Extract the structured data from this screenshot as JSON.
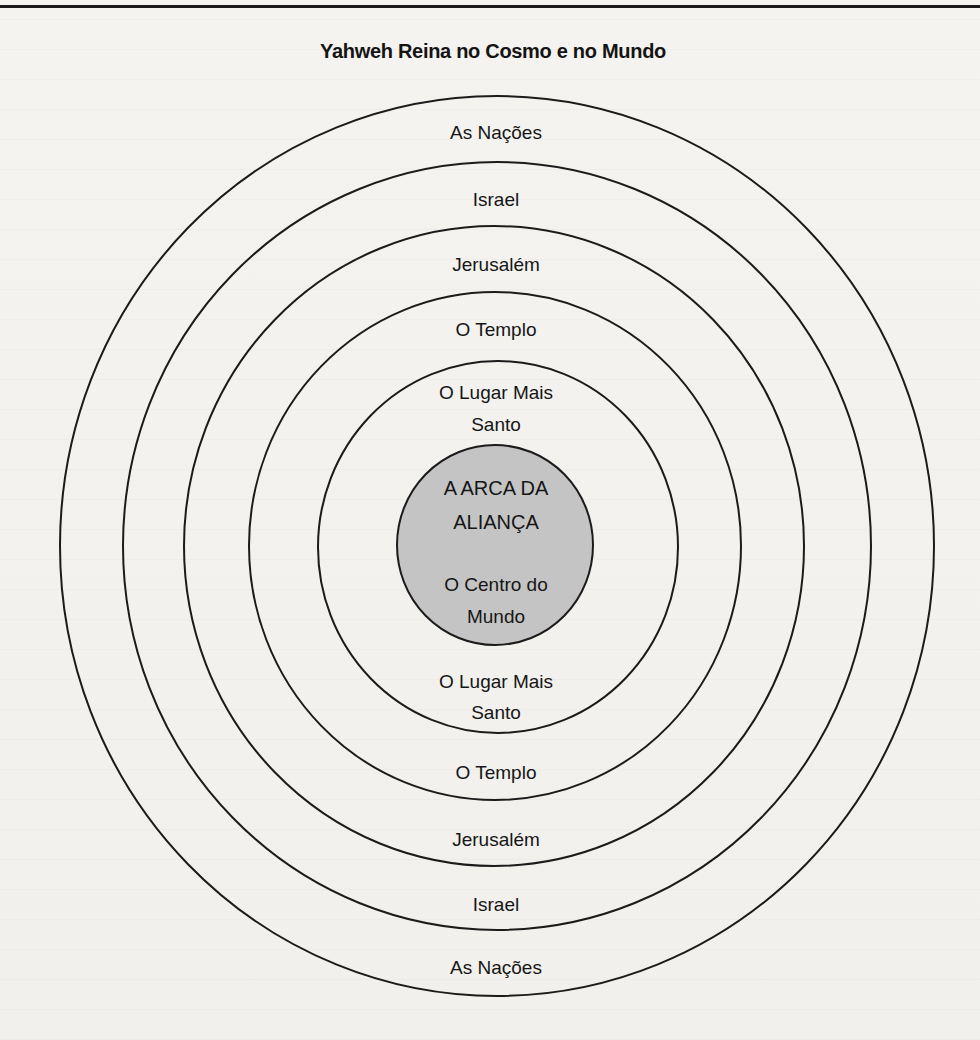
{
  "title": "Yahweh Reina no Cosmo e no Mundo",
  "colors": {
    "ring_stroke": "#1b1b1b",
    "center_fill": "#c4c4c4",
    "background": "#f3f2ef"
  },
  "diagram": {
    "type": "concentric-circles",
    "center": {
      "x": 496,
      "y": 546
    },
    "rings": [
      {
        "name": "As Nações",
        "rx": 437,
        "ry": 450
      },
      {
        "name": "Israel",
        "rx": 374,
        "ry": 384
      },
      {
        "name": "Jerusalém",
        "rx": 310,
        "ry": 320
      },
      {
        "name": "O Templo",
        "rx": 246,
        "ry": 254
      },
      {
        "name": "O Lugar Mais Santo",
        "rx": 180,
        "ry": 186
      },
      {
        "name": "A Arca da Aliança / O Centro do Mundo",
        "rx": 98,
        "ry": 100,
        "filled": true
      }
    ]
  },
  "labels": {
    "top": {
      "nations": "As Nações",
      "israel": "Israel",
      "jerusalem": "Jerusalém",
      "temple": "O Templo",
      "holiest_line1": "O Lugar Mais",
      "holiest_line2": "Santo"
    },
    "center": {
      "ark_line1": "A ARCA DA",
      "ark_line2": "ALIANÇA",
      "center_line1": "O Centro do",
      "center_line2": "Mundo"
    },
    "bottom": {
      "holiest_line1": "O Lugar Mais",
      "holiest_line2": "Santo",
      "temple": "O Templo",
      "jerusalem": "Jerusalém",
      "israel": "Israel",
      "nations": "As Nações"
    }
  }
}
